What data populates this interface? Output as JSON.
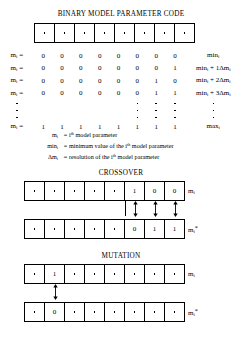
{
  "figure": {
    "sections": {
      "binary_code": {
        "title": "BINARY MODEL PARAMETER CODE",
        "strip": {
          "cells": [
            "dot",
            "dot",
            "dot",
            "dot",
            "dot",
            "dot",
            "dot",
            "dot"
          ],
          "cell_count": 8
        },
        "table": {
          "rows": [
            {
              "label_base": "m",
              "label_sub": "i",
              "label_eq": "=",
              "bits": [
                "0",
                "0",
                "0",
                "0",
                "0",
                "0",
                "0",
                "0"
              ],
              "value_prefix": "min",
              "value_sub": "i",
              "value_suffix": ""
            },
            {
              "label_base": "m",
              "label_sub": "i",
              "label_eq": "=",
              "bits": [
                "0",
                "0",
                "0",
                "0",
                "0",
                "0",
                "0",
                "1"
              ],
              "value_prefix": "min",
              "value_sub": "i",
              "value_suffix": " + 1Δm"
            },
            {
              "label_base": "m",
              "label_sub": "i",
              "label_eq": "=",
              "bits": [
                "0",
                "0",
                "0",
                "0",
                "0",
                "0",
                "1",
                "0"
              ],
              "value_prefix": "min",
              "value_sub": "i",
              "value_suffix": " + 2Δm"
            },
            {
              "label_base": "m",
              "label_sub": "i",
              "label_eq": "=",
              "bits": [
                "0",
                "0",
                "0",
                "0",
                "0",
                "0",
                "1",
                "1"
              ],
              "value_prefix": "min",
              "value_sub": "i",
              "value_suffix": " + 3Δm"
            }
          ],
          "ellipsis_rows": 3,
          "last_row": {
            "label_base": "m",
            "label_sub": "i",
            "label_eq": "=",
            "bits": [
              "1",
              "1",
              "1",
              "1",
              "1",
              "1",
              "1",
              "1"
            ],
            "value_prefix": "max",
            "value_sub": "i",
            "value_suffix": ""
          }
        }
      },
      "legend": {
        "entries": [
          {
            "symbol_base": "m",
            "symbol_sub": "i",
            "symbol_extra": "",
            "eq": "=",
            "text_pre": "i",
            "text_sup": "th",
            "text_post": " model parameter"
          },
          {
            "symbol_base": "min",
            "symbol_sub": "i",
            "symbol_extra": "",
            "eq": "=",
            "text_pre": "minimum value of the i",
            "text_sup": "th",
            "text_post": " model parameter"
          },
          {
            "symbol_base": "Δm",
            "symbol_sub": "i",
            "symbol_extra": "",
            "eq": "=",
            "text_pre": "resolution of the i",
            "text_sup": "th",
            "text_post": " model parameter"
          }
        ]
      },
      "crossover": {
        "title": "CROSSOVER",
        "row1": {
          "cells": [
            "dot",
            "dot",
            "dot",
            "dot",
            "dot",
            "1",
            "0",
            "0"
          ],
          "label_base": "m",
          "label_sub": "i",
          "label_star": ""
        },
        "row2": {
          "cells": [
            "dot",
            "dot",
            "dot",
            "dot",
            "dot",
            "0",
            "1",
            "1"
          ],
          "label_base": "m",
          "label_sub": "i",
          "label_star": "*"
        },
        "arrows": {
          "divider_after_cell": 5,
          "arrow_cells": [
            5,
            6,
            7
          ],
          "count": 3,
          "type": "double-headed-vertical"
        }
      },
      "mutation": {
        "title": "MUTATION",
        "row1": {
          "cells": [
            "dot",
            "1",
            "dot",
            "dot",
            "dot",
            "dot",
            "dot",
            "dot"
          ],
          "label_base": "m",
          "label_sub": "i",
          "label_star": ""
        },
        "row2": {
          "cells": [
            "dot",
            "0",
            "dot",
            "dot",
            "dot",
            "dot",
            "dot",
            "dot"
          ],
          "label_base": "m",
          "label_sub": "i",
          "label_star": "*"
        },
        "arrows": {
          "arrow_cells": [
            1
          ],
          "count": 1,
          "type": "double-headed-vertical"
        }
      }
    },
    "colors": {
      "ink": "#000000",
      "paper": "#ffffff"
    }
  }
}
